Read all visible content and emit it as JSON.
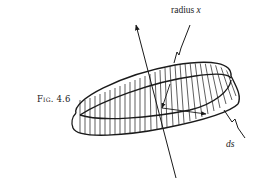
{
  "figure": {
    "caption": "Fig. 4.6",
    "caption_prefix": "Fig.",
    "caption_number": "4.6"
  },
  "labels": {
    "radius": "radius",
    "radius_var": "x",
    "ds": "ds"
  },
  "diagram": {
    "elements": [
      "ring-band",
      "axis-arrow",
      "radius-arrow",
      "tangent-arrow",
      "radius-leader",
      "ds-leader"
    ],
    "stroke_color": "#1a1a1a",
    "background": "#ffffff"
  }
}
